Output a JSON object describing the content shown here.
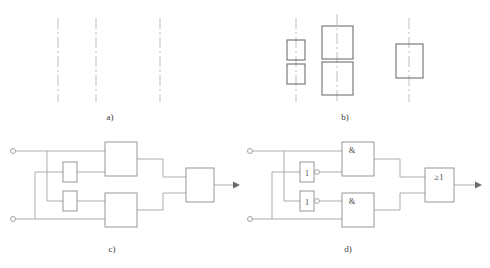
{
  "figure": {
    "background_color": "#ffffff",
    "line_color": "#9a9a9a",
    "box_color": "#8c8c8c",
    "dash_axis_color": "#b8b8b8",
    "text_color": "#3a3a3a"
  },
  "captions": [
    {
      "id": "a",
      "label": "a)",
      "x": 110,
      "y": 120
    },
    {
      "id": "b",
      "label": "b)",
      "x": 345,
      "y": 120
    },
    {
      "id": "c",
      "label": "c)",
      "x": 112,
      "y": 252
    },
    {
      "id": "d",
      "label": "d)",
      "x": 348,
      "y": 252
    }
  ],
  "panel_a": {
    "name": "panel-a-axes",
    "description": "three vertical dash-dot axis lines",
    "lines": [
      {
        "x": 58,
        "y1": 18,
        "y2": 102
      },
      {
        "x": 96,
        "y1": 18,
        "y2": 102
      },
      {
        "x": 160,
        "y1": 18,
        "y2": 102
      }
    ]
  },
  "panel_b": {
    "name": "panel-b-blocks-on-axes",
    "description": "three dash-dot axes carrying rectangular blocks",
    "groups": [
      {
        "axis": {
          "x": 296,
          "y1": 18,
          "y2": 102
        },
        "blocks": [
          {
            "x": 287,
            "y": 40,
            "w": 18,
            "h": 20
          },
          {
            "x": 287,
            "y": 64,
            "w": 18,
            "h": 20
          }
        ]
      },
      {
        "axis": {
          "x": 337,
          "y1": 14,
          "y2": 104
        },
        "blocks": [
          {
            "x": 322,
            "y": 26,
            "w": 31,
            "h": 33
          },
          {
            "x": 322,
            "y": 62,
            "w": 31,
            "h": 33
          }
        ]
      },
      {
        "axis": {
          "x": 409,
          "y1": 18,
          "y2": 102
        },
        "blocks": [
          {
            "x": 396,
            "y": 44,
            "w": 27,
            "h": 34
          }
        ]
      }
    ]
  },
  "panel_c": {
    "name": "panel-c-block-diagram",
    "description": "unlabelled block structure diagram with two inputs and one output",
    "terminals": [
      {
        "name": "input-terminal-top",
        "cx": 13,
        "cy": 151,
        "r": 2.5
      },
      {
        "name": "input-terminal-bottom",
        "cx": 13,
        "cy": 219,
        "r": 2.5
      }
    ],
    "blocks": [
      {
        "name": "small-block-upper",
        "x": 63,
        "y": 162,
        "w": 14,
        "h": 20
      },
      {
        "name": "small-block-lower",
        "x": 63,
        "y": 191,
        "w": 14,
        "h": 20
      },
      {
        "name": "large-block-upper",
        "x": 105,
        "y": 142,
        "w": 32,
        "h": 34
      },
      {
        "name": "large-block-lower",
        "x": 105,
        "y": 193,
        "w": 32,
        "h": 34
      },
      {
        "name": "output-block",
        "x": 186,
        "y": 168,
        "w": 28,
        "h": 34
      }
    ],
    "output_arrow": {
      "x1": 214,
      "y1": 185,
      "x2": 238,
      "y2": 185
    }
  },
  "panel_d": {
    "name": "panel-d-logic-diagram",
    "description": "logic gate diagram with NOT, AND and OR gates",
    "terminals": [
      {
        "name": "input-terminal-top",
        "cx": 250,
        "cy": 151,
        "r": 2.5
      },
      {
        "name": "input-terminal-bottom",
        "cx": 250,
        "cy": 219,
        "r": 2.5
      }
    ],
    "gates": [
      {
        "name": "not-gate-upper",
        "label": "1",
        "x": 300,
        "y": 162,
        "w": 14,
        "h": 20,
        "bubble": {
          "cx": 317,
          "cy": 172,
          "r": 2.4
        }
      },
      {
        "name": "not-gate-lower",
        "label": "1",
        "x": 300,
        "y": 191,
        "w": 14,
        "h": 20,
        "bubble": {
          "cx": 317,
          "cy": 201,
          "r": 2.4
        }
      },
      {
        "name": "and-gate-upper",
        "label": "&",
        "x": 342,
        "y": 142,
        "w": 32,
        "h": 34
      },
      {
        "name": "and-gate-lower",
        "label": "&",
        "x": 342,
        "y": 193,
        "w": 32,
        "h": 34
      },
      {
        "name": "or-gate-output",
        "label": "≥1",
        "x": 425,
        "y": 168,
        "w": 29,
        "h": 34
      }
    ],
    "output_arrow": {
      "x1": 454,
      "y1": 185,
      "x2": 480,
      "y2": 185
    }
  }
}
